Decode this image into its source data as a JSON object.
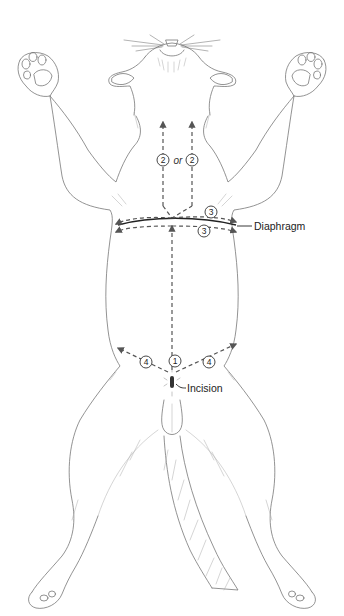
{
  "figure": {
    "labels": {
      "diaphragm": "Diaphragm",
      "incision": "Incision",
      "or": "or"
    },
    "steps": [
      {
        "id": "step-1",
        "number": "1",
        "description": "midline cut from incision toward diaphragm"
      },
      {
        "id": "step-2a",
        "number": "2",
        "description": "cut toward neck (left option)"
      },
      {
        "id": "step-2b",
        "number": "2",
        "description": "cut toward neck (right option)"
      },
      {
        "id": "step-3a",
        "number": "3",
        "description": "lateral cut anterior to diaphragm"
      },
      {
        "id": "step-3b",
        "number": "3",
        "description": "lateral cut posterior to diaphragm"
      },
      {
        "id": "step-4a",
        "number": "4",
        "description": "lateral cut toward left hind leg"
      },
      {
        "id": "step-4b",
        "number": "4",
        "description": "lateral cut toward right hind leg"
      }
    ],
    "colors": {
      "outline": "#777777",
      "cut_line": "#555555",
      "diaphragm": "#222222",
      "background": "#ffffff"
    }
  }
}
